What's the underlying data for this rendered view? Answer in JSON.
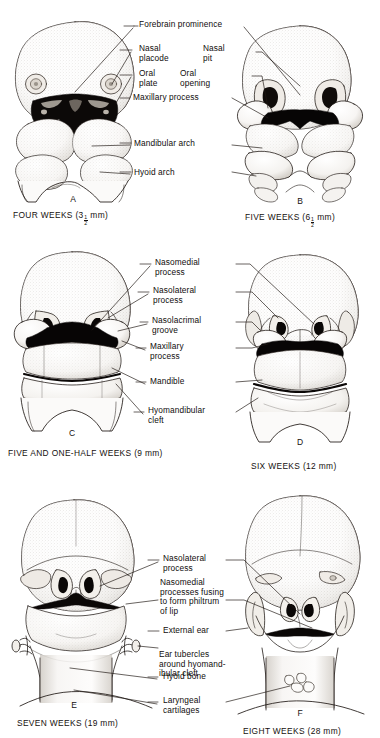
{
  "figure": {
    "background_color": "#ffffff",
    "ink_color": "#15100e"
  },
  "panels": [
    {
      "id": "A",
      "letter": "A",
      "caption_prefix": "FOUR WEEKS (3",
      "caption_fraction_num": "1",
      "caption_fraction_den": "2",
      "caption_suffix": " mm)",
      "stage": "four weeks",
      "size_mm": "3 1/2"
    },
    {
      "id": "B",
      "letter": "B",
      "caption_prefix": "FIVE WEEKS (6",
      "caption_fraction_num": "1",
      "caption_fraction_den": "2",
      "caption_suffix": " mm)",
      "stage": "five weeks",
      "size_mm": "6 1/2"
    },
    {
      "id": "C",
      "letter": "C",
      "caption_prefix": "FIVE AND ONE-HALF WEEKS (9 mm)",
      "caption_fraction_num": "",
      "caption_fraction_den": "",
      "caption_suffix": "",
      "stage": "five and one-half weeks",
      "size_mm": "9"
    },
    {
      "id": "D",
      "letter": "D",
      "caption_prefix": "SIX WEEKS (12 mm)",
      "caption_fraction_num": "",
      "caption_fraction_den": "",
      "caption_suffix": "",
      "stage": "six weeks",
      "size_mm": "12"
    },
    {
      "id": "E",
      "letter": "E",
      "caption_prefix": "SEVEN WEEKS (19 mm)",
      "caption_fraction_num": "",
      "caption_fraction_den": "",
      "caption_suffix": "",
      "stage": "seven weeks",
      "size_mm": "19"
    },
    {
      "id": "F",
      "letter": "F",
      "caption_prefix": "EIGHT WEEKS (28 mm)",
      "caption_fraction_num": "",
      "caption_fraction_den": "",
      "caption_suffix": "",
      "stage": "eight weeks",
      "size_mm": "28"
    }
  ],
  "labels_row1": [
    {
      "id": "forebrain-prominence",
      "text": "Forebrain prominence"
    },
    {
      "id": "nasal-placode",
      "text": "Nasal\nplacode"
    },
    {
      "id": "oral-plate",
      "text": "Oral\nplate"
    },
    {
      "id": "nasal-pit",
      "text": "Nasal\npit"
    },
    {
      "id": "oral-opening",
      "text": "Oral\nopening"
    },
    {
      "id": "maxillary-process",
      "text": "Maxillary process"
    },
    {
      "id": "mandibular-arch",
      "text": "Mandibular arch"
    },
    {
      "id": "hyoid-arch",
      "text": "Hyoid arch"
    }
  ],
  "labels_row2": [
    {
      "id": "nasomedial-process",
      "text": "Nasomedial\nprocess"
    },
    {
      "id": "nasolateral-process",
      "text": "Nasolateral\nprocess"
    },
    {
      "id": "nasolacrimal-groove",
      "text": "Nasolacrimal\ngroove"
    },
    {
      "id": "maxillary-process",
      "text": "Maxillary\nprocess"
    },
    {
      "id": "mandible",
      "text": "Mandible"
    },
    {
      "id": "hyomandibular-cleft",
      "text": "Hyomandibular\ncleft"
    }
  ],
  "labels_row3": [
    {
      "id": "nasolateral-process",
      "text": "Nasolateral\nprocess"
    },
    {
      "id": "nasomedial-processes-fusing",
      "text": "Nasomedial\nprocesses fusing\nto form philtrum\nof lip"
    },
    {
      "id": "external-ear",
      "text": "External ear"
    },
    {
      "id": "ear-tubercles",
      "text": "Ear tubercles\naround hyomand-\nibular cleft"
    },
    {
      "id": "hyoid-bone",
      "text": "Hyoid bone"
    },
    {
      "id": "laryngeal-cartilages",
      "text": "Laryngeal\ncartilages"
    }
  ]
}
